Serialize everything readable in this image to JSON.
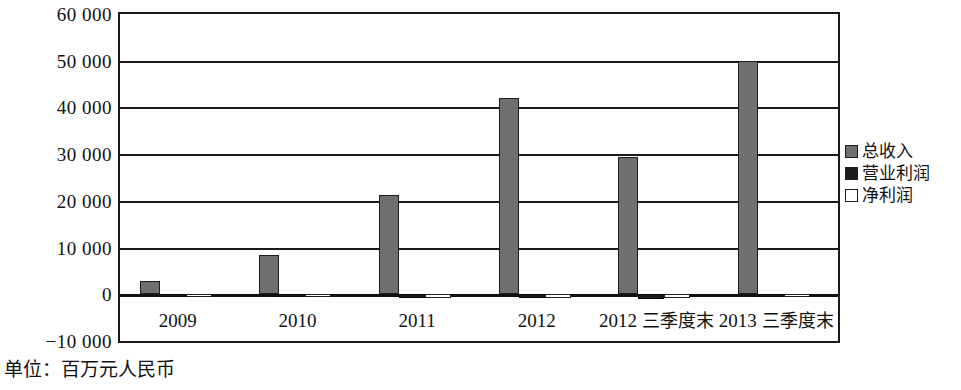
{
  "chart_data": {
    "type": "bar",
    "title": "",
    "subtitle": "",
    "xlabel": "",
    "ylabel": "",
    "unit_caption": "单位：百万元人民币",
    "categories": [
      "2009",
      "2010",
      "2011",
      "2012",
      "2012三季度末",
      "2013三季度末"
    ],
    "series": [
      {
        "name": "总收入",
        "color": "#6f6f6f",
        "values": [
          2800,
          8500,
          21300,
          42000,
          29300,
          50000
        ]
      },
      {
        "name": "营业利润",
        "color": "#1b1b1b",
        "values": [
          -200,
          -600,
          -900,
          -800,
          -1000,
          -400
        ]
      },
      {
        "name": "净利润",
        "color": "#ffffff",
        "values": [
          -150,
          -500,
          -800,
          -700,
          -900,
          -300
        ]
      }
    ],
    "ylim": [
      -10000,
      60000
    ],
    "yticks": [
      60000,
      50000,
      40000,
      30000,
      20000,
      10000,
      0,
      -10000
    ],
    "ytick_labels": [
      "60 000",
      "50 000",
      "40 000",
      "30 000",
      "20 000",
      "10 000",
      "0",
      "−10 000"
    ],
    "grid": true,
    "grid_axis": "y",
    "legend_position": "right",
    "legend": [
      "总收入",
      "营业利润",
      "净利润"
    ]
  }
}
